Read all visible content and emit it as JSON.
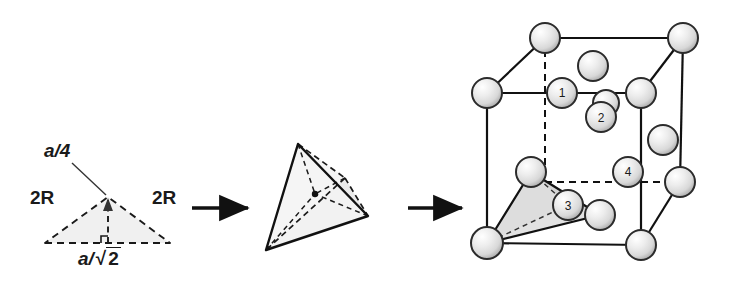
{
  "figure": {
    "panels": [
      {
        "name": "triangle-panel",
        "shape": "isosceles-triangle",
        "fill_color": "#f0f0f0",
        "edge_style": "dashed",
        "labels": {
          "apex_height": "a/4",
          "left_side": "2R",
          "right_side": "2R",
          "base": "a/√2"
        }
      },
      {
        "name": "tetrahedron-panel",
        "shape": "tetrahedron",
        "fill_color": "#f2f2f2",
        "outer_edge_style": "solid",
        "inner_edge_style": "dashed",
        "center_marker": "center-dot"
      },
      {
        "name": "unit-cell-panel",
        "shape": "fcc-cube",
        "visible_edge_style": "solid",
        "hidden_edge_style": "dashed",
        "tetrahedron_fill": "#e0e0e0",
        "sphere_labels": [
          "1",
          "2",
          "3",
          "4"
        ]
      }
    ],
    "arrows": [
      {
        "name": "arrow-1",
        "from": "triangle-panel",
        "to": "tetrahedron-panel"
      },
      {
        "name": "arrow-2",
        "from": "tetrahedron-panel",
        "to": "unit-cell-panel"
      }
    ],
    "colors": {
      "line": "#1a1a1a",
      "sphere_outline": "#2b2b2b",
      "sphere_light": "#ffffff",
      "sphere_mid": "#e2e2e2",
      "sphere_dark": "#b4b4b4",
      "triangle_fill": "#f0f0f0",
      "tetra_fill": "#e0e0e0"
    },
    "labels": {
      "a_over_4": "a/4",
      "two_r": "2R",
      "a_over_root2_prefix": "a/",
      "a_over_root2_radicand": "2",
      "sphere_1": "1",
      "sphere_2": "2",
      "sphere_3": "3",
      "sphere_4": "4"
    }
  }
}
